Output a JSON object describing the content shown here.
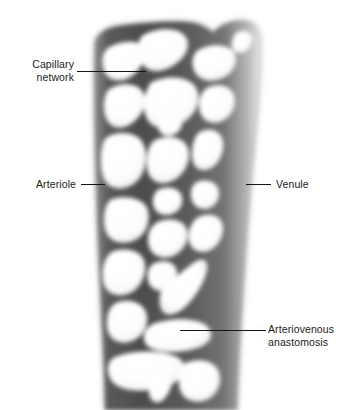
{
  "figure": {
    "width": 349,
    "height": 410,
    "background_color": "#ffffff",
    "vessel_color_dark": "#4a4a4a",
    "vessel_color_mid": "#6f6f6f",
    "vessel_color_light": "#d8d8d8",
    "lumen_color": "#ffffff",
    "leader_color": "#141414",
    "text_color": "#1b1b1b"
  },
  "labels": {
    "capillary_network": "Capillary\nnetwork",
    "arteriole": "Arteriole",
    "venule": "Venule",
    "arteriovenous_anastomosis": "Arteriovenous\nanastomosis"
  }
}
